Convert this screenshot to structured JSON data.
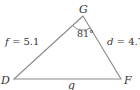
{
  "diagram": {
    "type": "triangle",
    "vertices": {
      "G": {
        "label": "G"
      },
      "D": {
        "label": "D"
      },
      "F": {
        "label": "F"
      }
    },
    "sides": {
      "f": {
        "var": "f",
        "eq": " = ",
        "value": "5.1"
      },
      "d": {
        "var": "d",
        "eq": " = ",
        "value": "4.7"
      },
      "g": {
        "var": "g"
      }
    },
    "angle_G": {
      "label": "81°"
    },
    "colors": {
      "stroke": "#8a8a8a",
      "text": "#333333",
      "background": "#ffffff"
    }
  }
}
